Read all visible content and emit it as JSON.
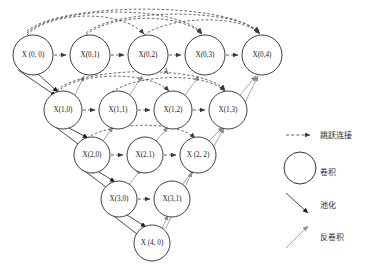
{
  "diagram": {
    "type": "unet-plus-plus-architecture",
    "annotation_marker": "A",
    "nodes": [
      {
        "id": "x00",
        "label": "X (0, 0)",
        "row": 0,
        "col": 0,
        "cx": 33,
        "cy": 55,
        "r": 20
      },
      {
        "id": "x01",
        "label": "X(0,1)",
        "row": 0,
        "col": 1,
        "cx": 90,
        "cy": 55,
        "r": 20
      },
      {
        "id": "x02",
        "label": "X(0,2)",
        "row": 0,
        "col": 2,
        "cx": 148,
        "cy": 55,
        "r": 20
      },
      {
        "id": "x03",
        "label": "X(0,3)",
        "row": 0,
        "col": 3,
        "cx": 205,
        "cy": 55,
        "r": 20
      },
      {
        "id": "x04",
        "label": "X(0,4)",
        "row": 0,
        "col": 4,
        "cx": 262,
        "cy": 55,
        "r": 20
      },
      {
        "id": "x10",
        "label": "X(1,0)",
        "row": 1,
        "col": 0,
        "cx": 63,
        "cy": 110,
        "r": 19
      },
      {
        "id": "x11",
        "label": "X(1,1)",
        "row": 1,
        "col": 1,
        "cx": 118,
        "cy": 110,
        "r": 19
      },
      {
        "id": "x12",
        "label": "X(1,2)",
        "row": 1,
        "col": 2,
        "cx": 173,
        "cy": 110,
        "r": 19
      },
      {
        "id": "x13",
        "label": "X(1,3)",
        "row": 1,
        "col": 3,
        "cx": 228,
        "cy": 110,
        "r": 19
      },
      {
        "id": "x20",
        "label": "X(2,0)",
        "row": 2,
        "col": 0,
        "cx": 92,
        "cy": 155,
        "r": 18
      },
      {
        "id": "x21",
        "label": "X(2,1)",
        "row": 2,
        "col": 1,
        "cx": 145,
        "cy": 155,
        "r": 18
      },
      {
        "id": "x22",
        "label": "X (2, 2)",
        "row": 2,
        "col": 2,
        "cx": 198,
        "cy": 155,
        "r": 18
      },
      {
        "id": "x30",
        "label": "X(3,0)",
        "row": 3,
        "col": 0,
        "cx": 119,
        "cy": 199,
        "r": 18
      },
      {
        "id": "x31",
        "label": "X(3,1)",
        "row": 3,
        "col": 1,
        "cx": 172,
        "cy": 199,
        "r": 18
      },
      {
        "id": "x40",
        "label": "X (4, 0)",
        "row": 4,
        "col": 0,
        "cx": 152,
        "cy": 243,
        "r": 18
      }
    ]
  },
  "legend": {
    "items": [
      {
        "key": "skip",
        "label": "跳跃连接",
        "glyph": "dashed-arrow-icon"
      },
      {
        "key": "conv",
        "label": "卷积",
        "glyph": "circle-icon"
      },
      {
        "key": "pool",
        "label": "池化",
        "glyph": "down-right-arrow-icon"
      },
      {
        "key": "deconv",
        "label": "反卷积",
        "glyph": "up-right-arrow-icon"
      }
    ]
  },
  "colors": {
    "stroke_dark": "#1d1d1d",
    "stroke_skip": "#3a3a3a",
    "stroke_deconv": "#8d8d8d",
    "background": "#ffffff"
  }
}
